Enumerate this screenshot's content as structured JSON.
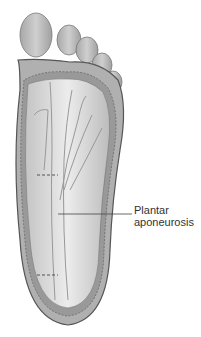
{
  "figure": {
    "labels": [
      {
        "line1": "Plantar",
        "line2": "aponeurosis"
      }
    ],
    "colors": {
      "skin": "#b8b8b8",
      "tissue": "#d8d8d8",
      "fat": "#9a9a9a",
      "outline": "#555555",
      "label_text": "#333333"
    }
  }
}
